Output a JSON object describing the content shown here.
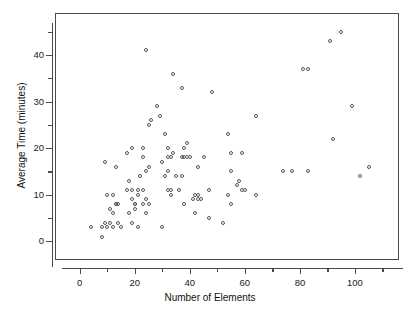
{
  "chart_data": {
    "type": "scatter",
    "title": "",
    "xlabel": "Number of Elements",
    "ylabel": "Average Time (minutes)",
    "xlim": [
      -9,
      116
    ],
    "ylim": [
      -4,
      49
    ],
    "xticks": [
      0,
      20,
      40,
      60,
      80,
      100
    ],
    "xtick_labels": [
      "0",
      "20",
      "40",
      "60",
      "80",
      "100"
    ],
    "yticks": [
      0,
      10,
      20,
      30,
      40
    ],
    "ytick_labels": [
      "0",
      "10",
      "20",
      "30",
      "40"
    ],
    "x_minor_ticks": [
      10,
      30,
      50,
      70,
      90,
      110
    ],
    "y_minor_ticks": [
      5,
      15,
      25,
      35,
      45
    ],
    "grid": false,
    "legend": null,
    "marker": "open-circle",
    "marker_color": "#58585c",
    "points": [
      [
        4,
        3
      ],
      [
        8,
        3
      ],
      [
        8,
        1
      ],
      [
        9,
        17
      ],
      [
        9,
        4
      ],
      [
        10,
        10
      ],
      [
        10,
        3
      ],
      [
        11,
        4
      ],
      [
        11,
        7
      ],
      [
        12,
        6
      ],
      [
        12,
        10
      ],
      [
        12,
        3
      ],
      [
        13,
        16
      ],
      [
        13,
        8
      ],
      [
        13,
        8
      ],
      [
        14,
        4
      ],
      [
        14,
        8
      ],
      [
        15,
        3
      ],
      [
        17,
        19
      ],
      [
        17,
        11
      ],
      [
        18,
        13
      ],
      [
        18,
        6
      ],
      [
        19,
        20
      ],
      [
        19,
        9
      ],
      [
        19,
        11
      ],
      [
        19,
        4
      ],
      [
        20,
        8
      ],
      [
        20,
        8
      ],
      [
        20,
        7
      ],
      [
        21,
        10
      ],
      [
        21,
        11
      ],
      [
        21,
        3
      ],
      [
        22,
        14
      ],
      [
        23,
        18
      ],
      [
        23,
        8
      ],
      [
        23,
        11
      ],
      [
        23,
        20
      ],
      [
        24,
        41
      ],
      [
        24,
        15
      ],
      [
        24,
        9
      ],
      [
        24,
        6
      ],
      [
        25,
        25
      ],
      [
        25,
        16
      ],
      [
        25,
        8
      ],
      [
        26,
        26
      ],
      [
        28,
        29
      ],
      [
        29,
        27
      ],
      [
        30,
        17
      ],
      [
        30,
        3
      ],
      [
        31,
        23
      ],
      [
        31,
        14
      ],
      [
        32,
        20
      ],
      [
        32,
        15
      ],
      [
        32,
        11
      ],
      [
        32,
        18
      ],
      [
        33,
        18
      ],
      [
        33,
        11
      ],
      [
        33,
        10
      ],
      [
        34,
        36
      ],
      [
        34,
        19
      ],
      [
        35,
        14
      ],
      [
        36,
        11
      ],
      [
        37,
        33
      ],
      [
        37,
        14
      ],
      [
        37,
        18
      ],
      [
        38,
        20
      ],
      [
        38,
        18
      ],
      [
        38,
        8
      ],
      [
        39,
        21
      ],
      [
        39,
        18
      ],
      [
        40,
        18
      ],
      [
        41,
        9
      ],
      [
        42,
        6
      ],
      [
        42,
        10
      ],
      [
        43,
        16
      ],
      [
        43,
        9
      ],
      [
        43,
        10
      ],
      [
        44,
        9
      ],
      [
        45,
        18
      ],
      [
        47,
        11
      ],
      [
        47,
        5
      ],
      [
        48,
        32
      ],
      [
        52,
        4
      ],
      [
        54,
        23
      ],
      [
        54,
        10
      ],
      [
        55,
        19
      ],
      [
        55,
        15
      ],
      [
        55,
        8
      ],
      [
        57,
        12
      ],
      [
        58,
        13
      ],
      [
        59,
        19
      ],
      [
        59,
        11
      ],
      [
        60,
        11
      ],
      [
        64,
        27
      ],
      [
        64,
        10
      ],
      [
        74,
        15
      ],
      [
        77,
        15
      ],
      [
        81,
        37
      ],
      [
        83,
        37
      ],
      [
        83,
        15
      ],
      [
        91,
        43
      ],
      [
        92,
        22
      ],
      [
        95,
        45
      ],
      [
        99,
        29
      ],
      [
        102,
        14
      ],
      [
        105,
        16
      ]
    ],
    "n_points": 106
  },
  "axes": {
    "x_title": "Number of Elements",
    "y_title": "Average Time (minutes)"
  }
}
